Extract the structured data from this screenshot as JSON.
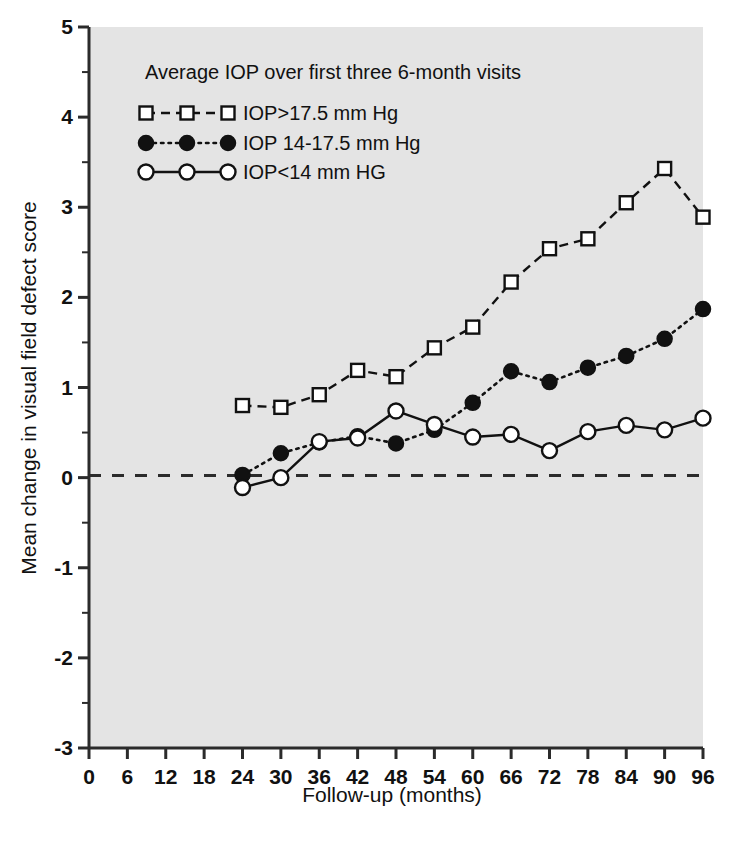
{
  "chart_data": {
    "type": "line",
    "title": "",
    "legend_title": "Average IOP over first three 6-month visits",
    "legend_position": "inside-top-left",
    "xlabel": "Follow-up (months)",
    "ylabel": "Mean change in visual field defect score",
    "xlim": [
      0,
      96
    ],
    "ylim": [
      -3,
      5
    ],
    "xticks": [
      0,
      6,
      12,
      18,
      24,
      30,
      36,
      42,
      48,
      54,
      60,
      66,
      72,
      78,
      84,
      90,
      96
    ],
    "xtick_labels": [
      "0",
      "6",
      "12",
      "18",
      "24",
      "30",
      "36",
      "42",
      "48",
      "54",
      "60",
      "66",
      "72",
      "78",
      "84",
      "90",
      "96"
    ],
    "yticks": [
      -3,
      -2,
      -1,
      0,
      1,
      2,
      3,
      4,
      5
    ],
    "ytick_labels": [
      "-3",
      "-2",
      "-1",
      "0",
      "1",
      "2",
      "3",
      "4",
      "5"
    ],
    "y_minor_ticks": [
      -2.5,
      -1.5,
      -0.5,
      0.5,
      1.5,
      2.5,
      3.5,
      4.5
    ],
    "grid": false,
    "zero_reference_line": 0,
    "series": [
      {
        "name": "IOP>17.5 mm Hg",
        "marker": "open-square",
        "line_style": "dashed",
        "x": [
          24,
          30,
          36,
          42,
          48,
          54,
          60,
          66,
          72,
          78,
          84,
          90,
          96
        ],
        "values": [
          0.8,
          0.78,
          0.92,
          1.19,
          1.12,
          1.44,
          1.67,
          2.17,
          2.54,
          2.65,
          3.05,
          3.43,
          2.89
        ]
      },
      {
        "name": "IOP 14-17.5 mm Hg",
        "marker": "filled-circle",
        "line_style": "dotted",
        "x": [
          24,
          30,
          36,
          42,
          48,
          54,
          60,
          66,
          72,
          78,
          84,
          90,
          96
        ],
        "values": [
          0.03,
          0.27,
          0.39,
          0.46,
          0.38,
          0.53,
          0.83,
          1.18,
          1.06,
          1.22,
          1.35,
          1.54,
          1.87
        ]
      },
      {
        "name": "IOP<14 mm HG",
        "marker": "open-circle",
        "line_style": "solid",
        "x": [
          24,
          30,
          36,
          42,
          48,
          54,
          60,
          66,
          72,
          78,
          84,
          90,
          96
        ],
        "values": [
          -0.11,
          0.0,
          0.4,
          0.44,
          0.74,
          0.59,
          0.45,
          0.48,
          0.3,
          0.51,
          0.58,
          0.53,
          0.66
        ]
      }
    ]
  },
  "colors": {
    "plot_background": "#e4e4e4",
    "page_background": "#ffffff",
    "ink": "#111111",
    "axis": "#2b2b2b"
  }
}
